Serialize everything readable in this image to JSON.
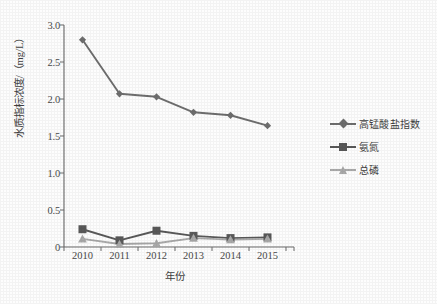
{
  "chart_data": {
    "type": "line",
    "title": "",
    "subtitle": "",
    "xlabel": "年份",
    "ylabel": "水质指标浓度/（mg/L）",
    "categories": [
      "2010",
      "2011",
      "2012",
      "2013",
      "2014",
      "2015"
    ],
    "x": [
      2010,
      2011,
      2012,
      2013,
      2014,
      2015
    ],
    "ylim": [
      0,
      3.0
    ],
    "yticks": [
      "0",
      "0.5",
      "1.0",
      "1.5",
      "2.0",
      "2.5",
      "3.0"
    ],
    "ytick_values": [
      0,
      0.5,
      1.0,
      1.5,
      2.0,
      2.5,
      3.0
    ],
    "grid": false,
    "legend_position": "right",
    "series": [
      {
        "name": "高锰酸盐指数",
        "marker": "diamond",
        "color": "#6e6e6e",
        "values": [
          2.8,
          2.07,
          2.03,
          1.82,
          1.78,
          1.64
        ]
      },
      {
        "name": "氨氮",
        "marker": "square",
        "color": "#595959",
        "values": [
          0.24,
          0.09,
          0.22,
          0.15,
          0.12,
          0.13
        ]
      },
      {
        "name": "总磷",
        "marker": "triangle",
        "color": "#a9a9a9",
        "values": [
          0.11,
          0.04,
          0.05,
          0.12,
          0.1,
          0.11
        ]
      }
    ]
  },
  "axes": {
    "axis_color": "#6a6a6a",
    "tick_color": "#6a6a6a"
  },
  "legend": {
    "entries": [
      {
        "label": "高锰酸盐指数"
      },
      {
        "label": "氨氮"
      },
      {
        "label": "总磷"
      }
    ]
  }
}
